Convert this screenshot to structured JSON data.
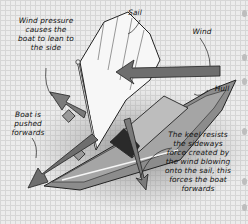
{
  "diagram": {
    "labels": {
      "wind_pressure": "Wind pressure causes the boat to lean to the side",
      "sail": "Sail",
      "wind": "Wind",
      "hull": "Hull",
      "boat_pushed": "Boat is pushed forwards",
      "keel": "The keel resists the sideways force created by the wind blowing onto the sail, this forces the boat forwards"
    },
    "colors": {
      "background": "#ececec",
      "grid": "#d6d6d6",
      "hull": "#8c8c8c",
      "deck": "#a9a9a9",
      "sail": "#f7f7f7",
      "arrow": "#6e6e6e",
      "shadow": "#9a9a9a"
    }
  }
}
